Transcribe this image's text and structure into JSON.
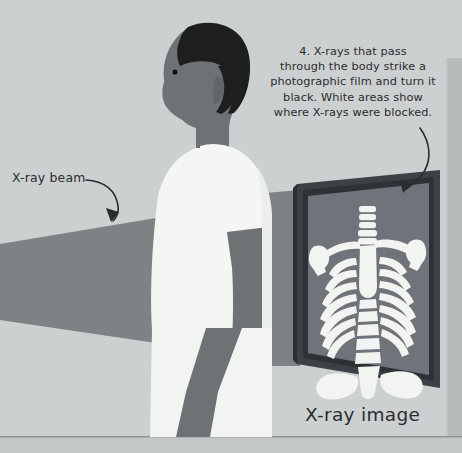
{
  "figure": {
    "background_color": "#cdd0d0",
    "floor_color": "#c6c9c9",
    "beam_color": "#7e8285",
    "shadow_color": "#6f7376",
    "skin_color": "#6e7275",
    "hair_color": "#1d1e20",
    "shirt_color": "#f4f6f4",
    "panel_frame_color": "#3c4145",
    "panel_inner_color": "#70747a",
    "bone_color": "#f2f4f1",
    "ink_color": "#2a2c2e"
  },
  "callouts": {
    "beam_label": "X-ray beam",
    "image_label": "X-ray image",
    "caption_lines": [
      "4. X-rays that pass",
      "through the body strike a",
      "photographic film and turn it",
      "black. White areas show",
      "where X-rays were blocked."
    ],
    "caption_full": "4. X-rays that pass through the body strike a photographic film and turn it black. White areas show where X-rays were blocked.",
    "step_number": "4"
  },
  "skeleton": {
    "parts": [
      "cervical-spine",
      "left-clavicle",
      "right-clavicle",
      "left-scapula",
      "right-scapula",
      "sternum",
      "ribcage",
      "lumbar-spine",
      "sacrum",
      "pelvis"
    ],
    "rib_pairs": 7,
    "lumbar_vertebrae": 6,
    "cervical_discs": 6
  },
  "person": {
    "pose": "standing profile facing left",
    "garment": "white short-sleeved t-shirt"
  }
}
